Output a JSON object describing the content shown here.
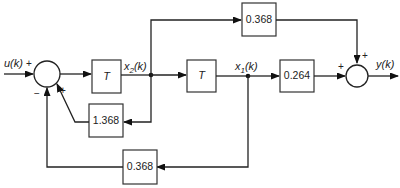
{
  "diagram": {
    "type": "block-diagram",
    "signals": {
      "input": "u(k)",
      "output": "y(k)",
      "state2": "x",
      "state2_sub": "2",
      "state2_arg": "(k)",
      "state1": "x",
      "state1_sub": "1",
      "state1_arg": "(k)"
    },
    "blocks": {
      "delay1": "T",
      "delay2": "T",
      "feedforward_top": "0.368",
      "output_gain": "0.264",
      "feedback_inner": "1.368",
      "feedback_outer": "0.368"
    },
    "summing_junctions": {
      "input_sum": {
        "signs": {
          "input": "+",
          "inner_feedback": "+",
          "outer_feedback": "−"
        }
      },
      "output_sum": {
        "signs": {
          "main": "+",
          "top": "+"
        }
      }
    },
    "colors": {
      "line": "#222222",
      "background": "#ffffff"
    }
  }
}
